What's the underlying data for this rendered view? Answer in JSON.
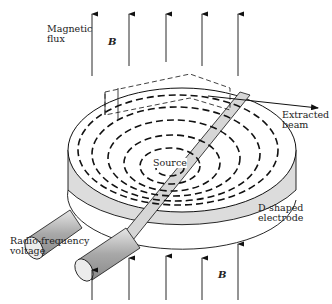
{
  "labels": {
    "magnetic_flux_1": "Magnetic",
    "magnetic_flux_2": "flux",
    "b_top": "B",
    "b_bottom": "B",
    "extracted_1": "Extracted",
    "extracted_2": "beam",
    "source": "Source",
    "d_shaped_1": "D-shaped",
    "d_shaped_2": "electrode",
    "rf_1": "Radio-frequency",
    "rf_2": "voltage"
  },
  "colors": {
    "line": "#111111",
    "shade": "#d9d9d9",
    "tube": "#a8a8a8",
    "tube_light": "#e6e6e6"
  }
}
